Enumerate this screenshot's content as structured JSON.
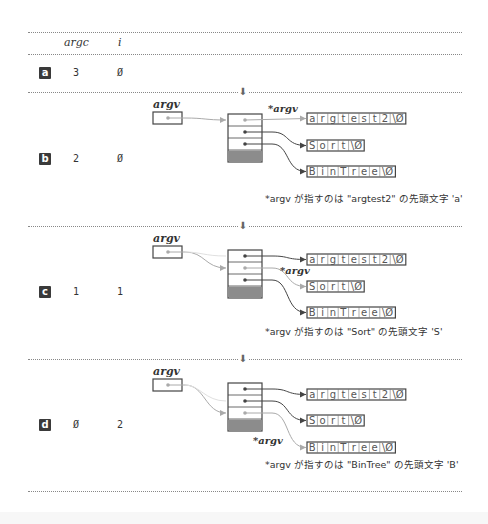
{
  "header": {
    "col_argc": "argc",
    "col_i": "i"
  },
  "rows": [
    {
      "label": "a",
      "argc": "3",
      "i": "Ø"
    },
    {
      "label": "b",
      "argc": "2",
      "i": "Ø"
    },
    {
      "label": "c",
      "argc": "1",
      "i": "1"
    },
    {
      "label": "d",
      "argc": "Ø",
      "i": "2"
    }
  ],
  "diagram": {
    "argv_label": "argv",
    "deref_label": "*argv",
    "strings": [
      {
        "chars": [
          "a",
          "r",
          "g",
          "t",
          "e",
          "s",
          "t",
          "2",
          "\\Ø"
        ]
      },
      {
        "chars": [
          "S",
          "o",
          "r",
          "t",
          "\\Ø"
        ]
      },
      {
        "chars": [
          "B",
          "i",
          "n",
          "T",
          "r",
          "e",
          "e",
          "\\Ø"
        ]
      }
    ],
    "captions": {
      "b": "*argv が指すのは \"argtest2\" の先頭文字 'a'",
      "c": "*argv が指すのは \"Sort\" の先頭文字 'S'",
      "d": "*argv が指すのは \"BinTree\" の先頭文字 'B'"
    },
    "arrow_glyph": "⬇"
  },
  "colors": {
    "line": "#444444",
    "faded": "#aaaaaa",
    "null_cell": "#8c8c8c",
    "badge_bg": "#3a3a3a"
  }
}
